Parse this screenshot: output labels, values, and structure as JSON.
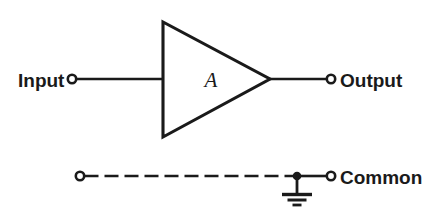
{
  "diagram": {
    "type": "amplifier-block-schematic",
    "background_color": "#ffffff",
    "ink_color": "#1a1a1a",
    "labels": {
      "input": "Input",
      "output": "Output",
      "common": "Common",
      "gain": "A"
    },
    "nodes": [
      {
        "name": "input-terminal",
        "label": "Input",
        "x": 72,
        "y": 79,
        "style": "open-circle"
      },
      {
        "name": "output-terminal",
        "label": "Output",
        "x": 331,
        "y": 79,
        "style": "open-circle"
      },
      {
        "name": "common-left-terminal",
        "label": "",
        "x": 80,
        "y": 176,
        "style": "open-circle"
      },
      {
        "name": "common-right-terminal",
        "label": "Common",
        "x": 331,
        "y": 176,
        "style": "open-circle"
      },
      {
        "name": "ground-junction",
        "label": "",
        "x": 297,
        "y": 176,
        "style": "filled-dot"
      }
    ],
    "amplifier": {
      "label": "A",
      "shape": "triangle",
      "apex_x": 270,
      "apex_y": 79,
      "left_x": 163,
      "top_y": 22,
      "bottom_y": 137
    },
    "wires": [
      {
        "name": "input-wire",
        "from": "input-terminal",
        "to": "amplifier-left",
        "style": "solid"
      },
      {
        "name": "output-wire",
        "from": "amplifier-apex",
        "to": "output-terminal",
        "style": "solid"
      },
      {
        "name": "common-dashed-wire",
        "from": "common-left-terminal",
        "to": "ground-junction",
        "style": "dashed"
      },
      {
        "name": "common-solid-wire",
        "from": "ground-junction",
        "to": "common-right-terminal",
        "style": "solid"
      }
    ],
    "ground_symbol": {
      "name": "earth-ground",
      "stem_x": 297,
      "stem_top_y": 176,
      "stem_bottom_y": 193,
      "bars": [
        {
          "width": 30,
          "y": 194
        },
        {
          "width": 19,
          "y": 199
        },
        {
          "width": 9,
          "y": 204
        }
      ]
    }
  }
}
